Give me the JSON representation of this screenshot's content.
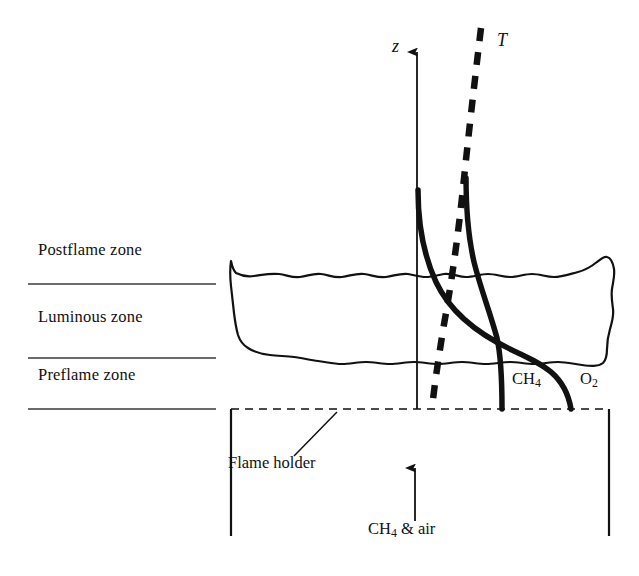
{
  "figure": {
    "background_color": "#ffffff",
    "ink_color": "#111111"
  },
  "zone_labels": [
    {
      "id": "postflame",
      "text": "Postflame zone",
      "x": 38,
      "y": 249
    },
    {
      "id": "luminous",
      "text": "Luminous zone",
      "x": 38,
      "y": 316
    },
    {
      "id": "preflame",
      "text": "Preflame zone",
      "x": 38,
      "y": 374
    }
  ],
  "divider_lines": [
    {
      "id": "postflame-luminous",
      "x1": 28,
      "y1": 284,
      "x2": 216,
      "y2": 284
    },
    {
      "id": "luminous-preflame",
      "x1": 28,
      "y1": 358,
      "x2": 216,
      "y2": 358
    },
    {
      "id": "preflame-holder",
      "x1": 28,
      "y1": 409,
      "x2": 216,
      "y2": 409
    }
  ],
  "axis": {
    "z_label": "z",
    "z_label_x": 392,
    "z_label_y": 45,
    "x": 417,
    "y_top": 48,
    "y_bottom": 409
  },
  "curves": {
    "temperature": {
      "name": "T",
      "label": "T",
      "label_x": 498,
      "label_y": 38,
      "style": "dashed",
      "stroke_width": 6.5,
      "dash_pattern": "13,11",
      "path": "M 481 28 C 474 86 468 140 463 188 C 458 236 452 280 443 330 C 438 362 434 388 432 409"
    },
    "methane": {
      "name": "CH4",
      "label": "CH",
      "label_sub": "4",
      "label_x": 515,
      "label_y": 378,
      "style": "solid",
      "stroke_width": 5.5,
      "path": "M 466 178 C 466 208 468 236 474 262 C 481 290 490 312 497 338 C 501 356 502 378 502 409"
    },
    "oxygen": {
      "name": "O2",
      "label": "O",
      "label_sub": "2",
      "label_x": 582,
      "label_y": 378,
      "style": "solid",
      "stroke_width": 5.5,
      "path": "M 418 190 C 418 224 424 256 436 282 C 450 312 478 334 512 350 C 542 364 565 374 571 409"
    }
  },
  "flame_envelope": {
    "name": "luminous-flame-envelope",
    "stroke_width": 2.2,
    "path": "M 231 261 C 232 266 233 270 236 273 C 242 276 248 277 254 276 C 262 275 270 273 279 274 C 287 275 292 278 300 277 C 308 276 313 273 321 274 C 329 275 334 278 342 277 C 350 276 356 273 364 274 C 372 275 378 278 386 277 C 394 276 400 273 408 274 C 414 275 420 277 426 277 C 432 277 438 275 444 274 C 452 273 458 277 466 277 C 474 277 480 274 488 274 C 496 274 502 277 510 277 C 518 277 524 274 532 274 C 540 274 546 277 554 277 C 562 277 570 274 578 272 C 586 270 592 266 597 262 C 601 259 604 256 607 257 C 611 258 613 263 614 269 C 615 276 613 282 612 289 C 611 296 612 302 613 309 C 614 316 612 322 610 329 C 608 336 607 342 607 349 C 607 355 606 360 603 363 C 598 367 590 366 582 365 C 574 364 566 362 558 362 C 550 362 542 364 534 364 C 526 364 518 362 510 362 C 502 362 494 364 486 364 C 478 364 470 362 462 362 C 454 362 446 364 438 364 C 430 364 422 362 414 362 C 406 362 398 364 390 364 C 382 364 374 362 366 362 C 358 362 350 364 342 364 C 334 364 326 362 318 361 C 310 360 302 358 294 357 C 286 356 278 356 270 355 C 262 354 254 352 248 348 C 243 345 240 341 238 335 C 236 328 235 321 234 313 C 233 304 232 295 231 286 C 230 277 230 268 231 261 Z"
  },
  "flame_holder": {
    "dashed_line": {
      "id": "holder-dashed-top",
      "x1": 231,
      "y1": 409,
      "x2": 609,
      "y2": 409,
      "dash_pattern": "8,6",
      "stroke_width": 1.6
    },
    "left_bracket": {
      "x": 231,
      "y1": 409,
      "y2": 536
    },
    "right_bracket": {
      "x": 609,
      "y1": 409,
      "y2": 536
    },
    "label": "Flame holder",
    "label_x": 228,
    "label_y": 462,
    "leader_line": {
      "x1": 294,
      "y1": 456,
      "x2": 337,
      "y2": 412
    }
  },
  "inlet": {
    "arrow": {
      "x": 415,
      "y_bottom": 521,
      "y_top": 464
    },
    "label": "CH",
    "label_sub": "4",
    "label_rest": " & air",
    "label_x": 370,
    "label_y": 528
  }
}
